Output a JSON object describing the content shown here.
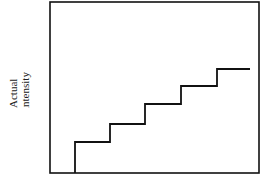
{
  "chart_data": {
    "type": "line",
    "title": "",
    "xlabel": "",
    "ylabel": "Actual intensity",
    "ylabel_lines": [
      "Actual",
      "intensity"
    ],
    "step": true,
    "grid": false,
    "points": [
      [
        75,
        0
      ],
      [
        75,
        31
      ],
      [
        110,
        31
      ],
      [
        110,
        49
      ],
      [
        145,
        49
      ],
      [
        145,
        69
      ],
      [
        181,
        69
      ],
      [
        181,
        87
      ],
      [
        217,
        87
      ],
      [
        217,
        104
      ],
      [
        250,
        104
      ]
    ],
    "steps": [
      {
        "level": 1,
        "x_start": 75,
        "x_end": 110
      },
      {
        "level": 2,
        "x_start": 110,
        "x_end": 145
      },
      {
        "level": 3,
        "x_start": 145,
        "x_end": 181
      },
      {
        "level": 4,
        "x_start": 181,
        "x_end": 217
      },
      {
        "level": 5,
        "x_start": 217,
        "x_end": 250
      }
    ]
  }
}
